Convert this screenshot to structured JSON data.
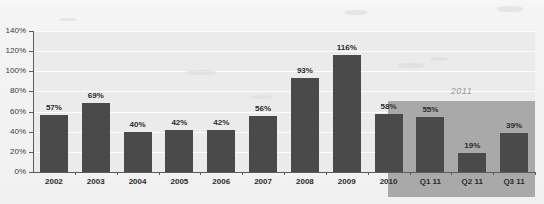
{
  "chart_data": {
    "type": "bar",
    "title": "",
    "subtitle": "",
    "xlabel": "",
    "ylabel": "",
    "categories": [
      "2002",
      "2003",
      "2004",
      "2005",
      "2006",
      "2007",
      "2008",
      "2009",
      "2010",
      "Q1 11",
      "Q2 11",
      "Q3 11"
    ],
    "values": [
      57,
      69,
      40,
      42,
      42,
      56,
      93,
      116,
      58,
      55,
      19,
      39
    ],
    "value_labels": [
      "57%",
      "69%",
      "40%",
      "42%",
      "42%",
      "56%",
      "93%",
      "116%",
      "58%",
      "55%",
      "19%",
      "39%"
    ],
    "ylim": [
      0,
      140
    ],
    "ytick_values": [
      0,
      20,
      40,
      60,
      80,
      100,
      120,
      140
    ],
    "ytick_labels": [
      "0%",
      "20%",
      "40%",
      "60%",
      "80%",
      "100%",
      "120%",
      "140%"
    ],
    "grid": true,
    "grid_axis": "y",
    "legend": false,
    "legend_position": "none",
    "series": [
      {
        "name": "",
        "values": [
          57,
          69,
          40,
          42,
          42,
          56,
          93,
          116,
          58,
          55,
          19,
          39
        ]
      }
    ],
    "annotations": [
      {
        "text": "2011",
        "type": "region-label",
        "style": "italic",
        "covers": [
          "Q1 11",
          "Q2 11",
          "Q3 11"
        ]
      }
    ],
    "shaded_regions": [
      {
        "label": "2011",
        "from_category": "Q1 11",
        "to_category": "Q3 11",
        "color": "#a9a9a9"
      }
    ],
    "colors": {
      "bar": "#4a4a4a",
      "plot_background": "#ebebeb",
      "gridline": "#fdfdfd",
      "axis": "#5d5d5d",
      "region_shading": "#a9a9a9",
      "region_label_text": "#9a9a9a",
      "tick_text": "#3a3a3a",
      "value_text": "#2c2c2c",
      "page_background": "#f2f2f2"
    }
  }
}
